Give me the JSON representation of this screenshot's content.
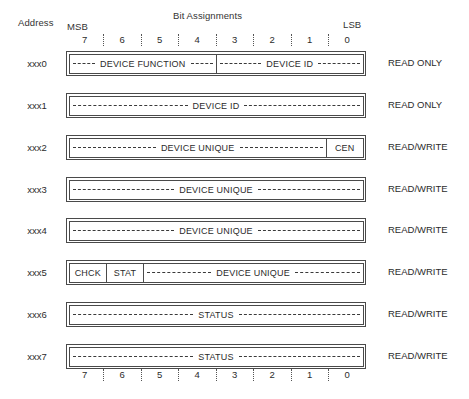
{
  "header": {
    "address_label": "Address",
    "bit_assignments_title": "Bit Assignments",
    "msb_label": "MSB",
    "lsb_label": "LSB"
  },
  "bit_scale": {
    "labels": [
      "7",
      "6",
      "5",
      "4",
      "3",
      "2",
      "1",
      "0"
    ]
  },
  "registers": [
    {
      "address": "xxx0",
      "access": "READ ONLY",
      "fields": [
        {
          "name": "DEVICE FUNCTION",
          "bits": 4,
          "style": "leader"
        },
        {
          "name": "DEVICE ID",
          "bits": 4,
          "style": "leader"
        }
      ]
    },
    {
      "address": "xxx1",
      "access": "READ ONLY",
      "fields": [
        {
          "name": "DEVICE ID",
          "bits": 8,
          "style": "leader"
        }
      ]
    },
    {
      "address": "xxx2",
      "access": "READ/WRITE",
      "fields": [
        {
          "name": "DEVICE UNIQUE",
          "bits": 7,
          "style": "leader"
        },
        {
          "name": "CEN",
          "bits": 1,
          "style": "plain"
        }
      ]
    },
    {
      "address": "xxx3",
      "access": "READ/WRITE",
      "fields": [
        {
          "name": "DEVICE UNIQUE",
          "bits": 8,
          "style": "leader"
        }
      ]
    },
    {
      "address": "xxx4",
      "access": "READ/WRITE",
      "fields": [
        {
          "name": "DEVICE UNIQUE",
          "bits": 8,
          "style": "leader"
        }
      ]
    },
    {
      "address": "xxx5",
      "access": "READ/WRITE",
      "fields": [
        {
          "name": "CHCK",
          "bits": 1,
          "style": "plain"
        },
        {
          "name": "STAT",
          "bits": 1,
          "style": "plain"
        },
        {
          "name": "DEVICE UNIQUE",
          "bits": 6,
          "style": "leader"
        }
      ]
    },
    {
      "address": "xxx6",
      "access": "READ/WRITE",
      "fields": [
        {
          "name": "STATUS",
          "bits": 8,
          "style": "leader"
        }
      ]
    },
    {
      "address": "xxx7",
      "access": "READ/WRITE",
      "fields": [
        {
          "name": "STATUS",
          "bits": 8,
          "style": "leader"
        }
      ]
    }
  ],
  "layout": {
    "row_tops": [
      50,
      92,
      134,
      176,
      217,
      259,
      301,
      343
    ],
    "colors": {
      "ink": "#2b2b2b",
      "line": "#4a4a4a",
      "background": "#ffffff"
    }
  }
}
